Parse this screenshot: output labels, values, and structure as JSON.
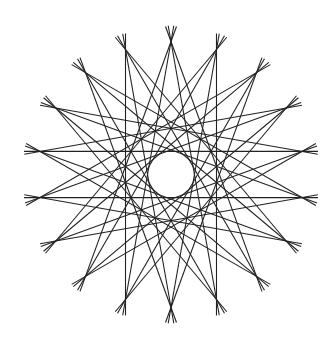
{
  "figure": {
    "points": 18,
    "center": [
      171,
      174.5
    ],
    "radius": 133,
    "skips": [
      7,
      8
    ],
    "overshoot": 16,
    "stroke_color": "#222222",
    "background": "#ffffff"
  }
}
